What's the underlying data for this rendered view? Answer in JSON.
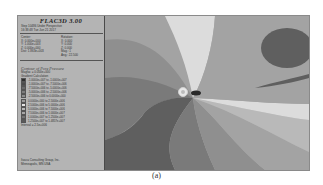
{
  "figure": {
    "caption": "(a)"
  },
  "panel": {
    "app_title": "FLAC3D 3.00",
    "step_line": "Step 10486  Under Perspective",
    "time_line": "16:38:48 Tue Jun 21 2017",
    "center_label": "Center:",
    "rotation_label": "Rotation:",
    "center": [
      "X: 0.000e+000",
      "Y: 1.000e+003",
      "Z: 0.000e+000"
    ],
    "rotation": [
      "X:  0.000",
      "Y:  0.000",
      "Z:  0.000"
    ],
    "dist": "Dist: 1.863e+003",
    "mag": "Mag.:      1",
    "ang": "Ang.: 22.500",
    "contour_title": "Contour of Pore Pressure",
    "magfac": "Magfac = 0.000e+000",
    "gradient": "Gradient Calculation",
    "legend": [
      {
        "range": "-1.0000e+007 to -1.0000e+007",
        "color": "#2e2e2e"
      },
      {
        "range": "-1.0000e+007 to -7.5000e+006",
        "color": "#4c4c4c"
      },
      {
        "range": "-7.5000e+006 to -5.0000e+006",
        "color": "#6a6a6a"
      },
      {
        "range": "-5.0000e+006 to -2.5000e+006",
        "color": "#7c7c7c"
      },
      {
        "range": "-2.5000e+006 to  0.0000e+000",
        "color": "#8c8c8c"
      },
      {
        "range": " 0.0000e+000 to  2.5000e+006",
        "color": "#9a9a9a"
      },
      {
        "range": " 2.5000e+006 to  5.0000e+006",
        "color": "#e4e4e4"
      },
      {
        "range": " 5.0000e+006 to  7.5000e+006",
        "color": "#b8b8b8"
      },
      {
        "range": " 7.5000e+006 to  1.0000e+007",
        "color": "#a6a6a6"
      },
      {
        "range": " 1.0000e+007 to  1.2500e+007",
        "color": "#747474"
      },
      {
        "range": " 1.2500e+007 to  1.4857e+007",
        "color": "#5a5a5a"
      }
    ],
    "interval": "Interval = 2.5e+006",
    "company": "Itasca Consulting Group, Inc.",
    "location": "Minneapolis, MN  USA"
  },
  "colors": {
    "band_darkest": "#5f5f5f",
    "band_dark": "#7a7a7a",
    "band_mid": "#8f8f8f",
    "band_midlight": "#a3a3a3",
    "band_light": "#b9b9b9",
    "band_lightest": "#dcdcdc",
    "background": "#a9a9a9"
  }
}
